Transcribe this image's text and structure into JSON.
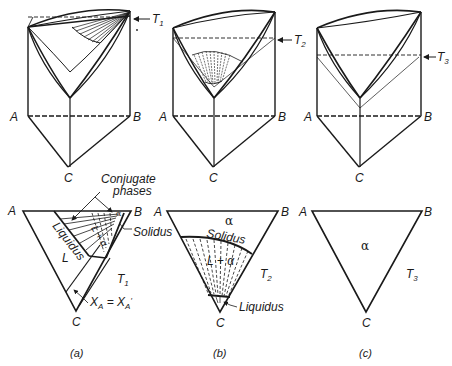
{
  "figure": {
    "panels": [
      {
        "id": "a",
        "caption": "(a)",
        "temperature_label": "T",
        "temperature_sub": "1",
        "prism_vertices": {
          "A": "A",
          "B": "B",
          "C": "C"
        },
        "section_vertices": {
          "A": "A",
          "B": "B",
          "C": "C"
        },
        "region_labels": {
          "liquid": "L",
          "two_phase": "L + α",
          "solid": "α",
          "liquidus": "Liquidus",
          "solidus": "Solidus"
        },
        "annotations": {
          "conjugate_line1": "Conjugate",
          "conjugate_line2": "phases",
          "isocomp": "X",
          "isocomp_sub": "A",
          "isocomp_eq": " = X",
          "isocomp_sub2": "A",
          "isocomp_prime": "′"
        }
      },
      {
        "id": "b",
        "caption": "(b)",
        "temperature_label": "T",
        "temperature_sub": "2",
        "prism_vertices": {
          "A": "A",
          "B": "B",
          "C": "C"
        },
        "section_vertices": {
          "A": "A",
          "B": "B",
          "C": "C"
        },
        "region_labels": {
          "solid": "α",
          "two_phase": "L + α",
          "solidus": "Solidus",
          "liquidus": "Liquidus"
        }
      },
      {
        "id": "c",
        "caption": "(c)",
        "temperature_label": "T",
        "temperature_sub": "3",
        "prism_vertices": {
          "A": "A",
          "B": "B",
          "C": "C"
        },
        "section_vertices": {
          "A": "A",
          "B": "B",
          "C": "C"
        },
        "region_labels": {
          "solid": "α"
        }
      }
    ],
    "colors": {
      "line": "#1a1a1a",
      "background": "#ffffff"
    }
  }
}
